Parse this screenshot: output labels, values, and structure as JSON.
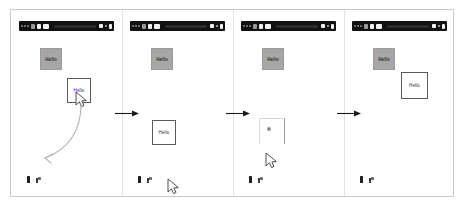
{
  "meta": {
    "figure_type": "storyboard-filmstrip",
    "panel_count": 4,
    "background_color": "#ffffff",
    "frame_border_color": "#c9c9c9"
  },
  "labels": {
    "gray_block_text": "Hello",
    "white_card_text": "Hello"
  },
  "colors": {
    "titlebar": "#111111",
    "gray_block": "#a6a6a6",
    "white_card_border": "#5a5a5a",
    "arrow": "#1a1a1a",
    "curve_arrow": "#b5b5b5",
    "ghost_dot": "#8e8e8e",
    "taskbar_icon": "#202020"
  },
  "icons": {
    "titlebar_traffic_lights": "window-controls-icon",
    "cursor": "mouse-pointer-icon",
    "flow_arrow": "arrow-right-icon",
    "curve_arrow": "curved-motion-arrow-icon",
    "taskbar_app_1": "app-icon",
    "taskbar_app_2": "folder-icon",
    "ghost_dot": "drop-indicator-icon"
  },
  "panels": [
    {
      "index": 1,
      "name": "panel-1-drag-start",
      "titlebar": {
        "name": "window-titlebar"
      },
      "gray_block": {
        "text": "Hello",
        "x": 29,
        "y": 38,
        "w": 22,
        "h": 22
      },
      "white_card": {
        "text": "Hello",
        "x": 56,
        "y": 68,
        "w": 24,
        "h": 25
      },
      "cursor": {
        "x": 64,
        "y": 81
      },
      "curve_arrow": {
        "present": true
      },
      "ghost_card": {
        "present": false
      },
      "taskbar": {
        "x": 16,
        "y": 166
      }
    },
    {
      "index": 2,
      "name": "panel-2-drag-moved",
      "titlebar": {
        "name": "window-titlebar"
      },
      "gray_block": {
        "text": "Hello",
        "x": 29,
        "y": 38,
        "w": 22,
        "h": 22
      },
      "white_card": {
        "text": "Hello",
        "x": 30,
        "y": 110,
        "w": 24,
        "h": 25
      },
      "cursor": {
        "x": 45,
        "y": 168
      },
      "curve_arrow": {
        "present": false
      },
      "ghost_card": {
        "present": false
      },
      "taskbar": {
        "x": 16,
        "y": 166
      }
    },
    {
      "index": 3,
      "name": "panel-3-drop-target",
      "titlebar": {
        "name": "window-titlebar"
      },
      "gray_block": {
        "text": "Hello",
        "x": 29,
        "y": 38,
        "w": 22,
        "h": 22
      },
      "white_card": {
        "present": false
      },
      "cursor": {
        "x": 32,
        "y": 142
      },
      "curve_arrow": {
        "present": false
      },
      "ghost_card": {
        "present": true,
        "x": 26,
        "y": 108,
        "w": 26,
        "h": 26
      },
      "taskbar": {
        "x": 16,
        "y": 166
      }
    },
    {
      "index": 4,
      "name": "panel-4-drop-complete",
      "titlebar": {
        "name": "window-titlebar"
      },
      "gray_block": {
        "text": "Hello",
        "x": 29,
        "y": 38,
        "w": 22,
        "h": 22
      },
      "white_card": {
        "text": "Hello",
        "x": 57,
        "y": 62,
        "w": 27,
        "h": 27
      },
      "cursor": {
        "present": false
      },
      "curve_arrow": {
        "present": false
      },
      "ghost_card": {
        "present": false
      },
      "taskbar": {
        "x": 16,
        "y": 166
      }
    }
  ],
  "flow_arrows": [
    {
      "name": "flow-arrow-1-to-2",
      "x": 103,
      "y": 99
    },
    {
      "name": "flow-arrow-2-to-3",
      "x": 214,
      "y": 99
    },
    {
      "name": "flow-arrow-3-to-4",
      "x": 325,
      "y": 99
    }
  ]
}
